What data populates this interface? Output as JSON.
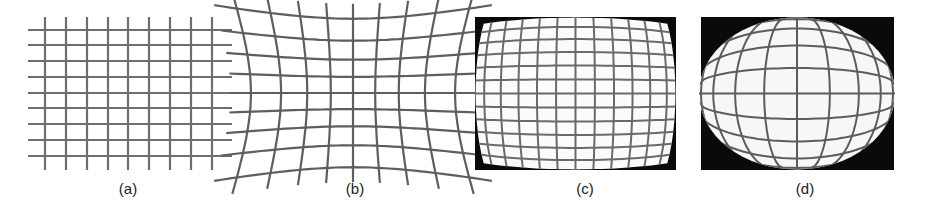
{
  "figure": {
    "panels": [
      {
        "id": "a",
        "caption": "(a)",
        "description": "undistorted rectilinear grid",
        "caption_x": 128
      },
      {
        "id": "b",
        "caption": "(b)",
        "description": "pincushion distortion grid",
        "caption_x": 355
      },
      {
        "id": "c",
        "caption": "(c)",
        "description": "barrel distortion grid on black background",
        "caption_x": 585
      },
      {
        "id": "d",
        "caption": "(d)",
        "description": "fisheye / strong barrel distortion, elliptical grid on black background",
        "caption_x": 805
      }
    ],
    "colors": {
      "grid_line": "#6e6e6e",
      "background": "#ffffff",
      "frame_black": "#0a0a0a"
    }
  }
}
